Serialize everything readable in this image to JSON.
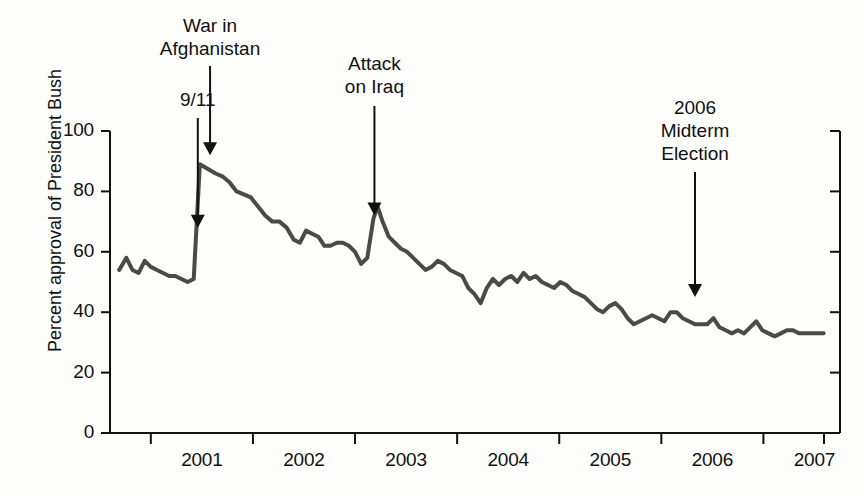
{
  "chart_data": {
    "type": "line",
    "title": "",
    "subtitle": "",
    "xlabel": "",
    "ylabel": "Percent approval of President Bush",
    "ylim": [
      0,
      100
    ],
    "xlim": [
      2000.6,
      2007.75
    ],
    "yticks": [
      0,
      20,
      40,
      60,
      80,
      100
    ],
    "ytick_labels": [
      "0",
      "20",
      "40",
      "60",
      "80",
      "100"
    ],
    "xticks": [
      2001,
      2002,
      2003,
      2004,
      2005,
      2006,
      2007
    ],
    "xtick_labels": [
      "2001",
      "2002",
      "2003",
      "2004",
      "2005",
      "2006",
      "2007"
    ],
    "grid": false,
    "legend": null,
    "line_color": "#4a4a4a",
    "line_width": 4,
    "series_name": "Percent approval of President Bush",
    "x": [
      2000.69,
      2000.76,
      2000.82,
      2000.88,
      2000.94,
      2001.0,
      2001.06,
      2001.12,
      2001.18,
      2001.24,
      2001.3,
      2001.36,
      2001.42,
      2001.48,
      2001.53,
      2001.58,
      2001.63,
      2001.7,
      2001.77,
      2001.84,
      2001.91,
      2001.98,
      2002.05,
      2002.12,
      2002.19,
      2002.26,
      2002.33,
      2002.4,
      2002.46,
      2002.52,
      2002.58,
      2002.64,
      2002.7,
      2002.76,
      2002.82,
      2002.88,
      2002.94,
      2003.0,
      2003.06,
      2003.12,
      2003.18,
      2003.22,
      2003.27,
      2003.33,
      2003.39,
      2003.45,
      2003.51,
      2003.57,
      2003.63,
      2003.69,
      2003.75,
      2003.81,
      2003.87,
      2003.93,
      2003.99,
      2004.05,
      2004.11,
      2004.17,
      2004.23,
      2004.29,
      2004.35,
      2004.41,
      2004.47,
      2004.53,
      2004.59,
      2004.65,
      2004.71,
      2004.77,
      2004.83,
      2004.89,
      2004.95,
      2005.01,
      2005.07,
      2005.13,
      2005.19,
      2005.25,
      2005.31,
      2005.37,
      2005.43,
      2005.49,
      2005.55,
      2005.61,
      2005.67,
      2005.73,
      2005.79,
      2005.85,
      2005.91,
      2005.97,
      2006.03,
      2006.09,
      2006.15,
      2006.21,
      2006.27,
      2006.33,
      2006.39,
      2006.45,
      2006.51,
      2006.57,
      2006.63,
      2006.69,
      2006.75,
      2006.81,
      2006.87,
      2006.93,
      2006.99,
      2007.05,
      2007.11,
      2007.17,
      2007.23,
      2007.29,
      2007.35,
      2007.41,
      2007.47,
      2007.53,
      2007.59
    ],
    "y": [
      54,
      58,
      54,
      53,
      57,
      55,
      54,
      53,
      52,
      52,
      51,
      50,
      51,
      89,
      88,
      87,
      86,
      85,
      83,
      80,
      79,
      78,
      75,
      72,
      70,
      70,
      68,
      64,
      63,
      67,
      66,
      65,
      62,
      62,
      63,
      63,
      62,
      60,
      56,
      58,
      71,
      75,
      70,
      65,
      63,
      61,
      60,
      58,
      56,
      54,
      55,
      57,
      56,
      54,
      53,
      52,
      48,
      46,
      43,
      48,
      51,
      49,
      51,
      52,
      50,
      53,
      51,
      52,
      50,
      49,
      48,
      50,
      49,
      47,
      46,
      45,
      43,
      41,
      40,
      42,
      43,
      41,
      38,
      36,
      37,
      38,
      39,
      38,
      37,
      40,
      40,
      38,
      37,
      36,
      36,
      36,
      38,
      35,
      34,
      33,
      34,
      33,
      35,
      37,
      34,
      33,
      32,
      33,
      34,
      34,
      33,
      33,
      33,
      33,
      33
    ],
    "annotations": [
      {
        "id": "nine-eleven",
        "text": "9/11",
        "lines": [
          "9/11"
        ],
        "arrow_x": 2001.46,
        "arrow_head_y": 68
      },
      {
        "id": "war-in-afghanistan",
        "text": "War in Afghanistan",
        "lines": [
          "War in",
          "Afghanistan"
        ],
        "arrow_x": 2001.58,
        "arrow_head_y": 92
      },
      {
        "id": "attack-on-iraq",
        "text": "Attack on Iraq",
        "lines": [
          "Attack",
          "on Iraq"
        ],
        "arrow_x": 2003.19,
        "arrow_head_y": 72
      },
      {
        "id": "midterm-election",
        "text": "2006 Midterm Election",
        "lines": [
          "2006",
          "Midterm",
          "Election"
        ],
        "arrow_x": 2006.33,
        "arrow_head_y": 45
      }
    ]
  },
  "axes": {
    "left_spine": true,
    "right_spine": true,
    "bottom_spine": true,
    "tick_color": "#111111"
  }
}
